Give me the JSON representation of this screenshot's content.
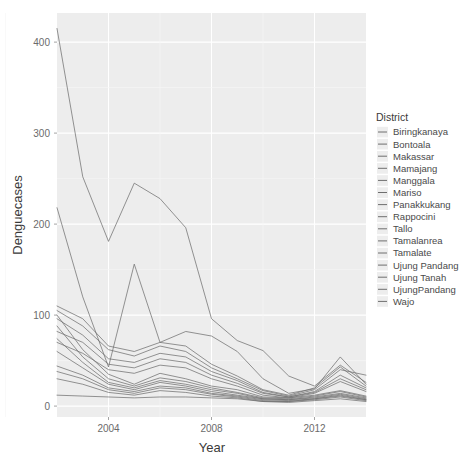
{
  "chart_data": {
    "type": "line",
    "title": "",
    "xlabel": "Year",
    "ylabel": "Denguecases",
    "xlim": [
      2002,
      2014
    ],
    "ylim": [
      -12,
      432
    ],
    "xticks": [
      2004,
      2008,
      2012
    ],
    "yticks": [
      0,
      100,
      200,
      300,
      400
    ],
    "xtick_labels": [
      "2004",
      "2008",
      "2012"
    ],
    "ytick_labels": [
      "0",
      "100",
      "200",
      "300",
      "400"
    ],
    "grid": true,
    "legend_position": "right",
    "legend_title": "District",
    "x": [
      2002,
      2003,
      2004,
      2005,
      2006,
      2007,
      2008,
      2009,
      2010,
      2011,
      2012,
      2013,
      2014
    ],
    "series": [
      {
        "name": "Biringkanaya",
        "values": [
          415,
          252,
          181,
          245,
          228,
          196,
          96,
          72,
          61,
          33,
          22,
          45,
          26
        ]
      },
      {
        "name": "Bontoala",
        "values": [
          100,
          62,
          35,
          24,
          36,
          30,
          22,
          18,
          10,
          9,
          12,
          17,
          11
        ]
      },
      {
        "name": "Makassar",
        "values": [
          88,
          54,
          30,
          22,
          31,
          27,
          20,
          15,
          9,
          8,
          11,
          16,
          10
        ]
      },
      {
        "name": "Mamajang",
        "values": [
          74,
          48,
          26,
          20,
          28,
          24,
          18,
          14,
          8,
          7,
          10,
          14,
          9
        ]
      },
      {
        "name": "Manggala",
        "values": [
          218,
          120,
          43,
          156,
          70,
          82,
          77,
          60,
          30,
          14,
          19,
          54,
          24
        ]
      },
      {
        "name": "Mariso",
        "values": [
          60,
          42,
          24,
          18,
          26,
          22,
          16,
          12,
          8,
          7,
          9,
          13,
          8
        ]
      },
      {
        "name": "Panakkukang",
        "values": [
          110,
          96,
          66,
          60,
          70,
          66,
          46,
          33,
          18,
          12,
          20,
          43,
          22
        ]
      },
      {
        "name": "Rappocini",
        "values": [
          105,
          88,
          62,
          55,
          66,
          60,
          42,
          30,
          17,
          11,
          18,
          40,
          34
        ]
      },
      {
        "name": "Tallo",
        "values": [
          96,
          78,
          52,
          48,
          58,
          54,
          38,
          28,
          15,
          10,
          16,
          34,
          20
        ]
      },
      {
        "name": "Tamalanrea",
        "values": [
          82,
          70,
          46,
          42,
          52,
          48,
          34,
          25,
          14,
          10,
          15,
          30,
          18
        ]
      },
      {
        "name": "Tamalate",
        "values": [
          70,
          58,
          40,
          36,
          45,
          42,
          30,
          22,
          12,
          9,
          14,
          27,
          16
        ]
      },
      {
        "name": "Ujung Pandang",
        "values": [
          44,
          34,
          20,
          16,
          22,
          20,
          14,
          11,
          7,
          6,
          8,
          12,
          7
        ]
      },
      {
        "name": "Ujung Tanah",
        "values": [
          38,
          30,
          18,
          14,
          20,
          18,
          13,
          10,
          6,
          5,
          8,
          11,
          7
        ]
      },
      {
        "name": "UjungPandang",
        "values": [
          30,
          24,
          15,
          12,
          17,
          15,
          11,
          9,
          5,
          5,
          7,
          10,
          6
        ]
      },
      {
        "name": "Wajo",
        "values": [
          12,
          11,
          10,
          9,
          10,
          10,
          9,
          8,
          5,
          4,
          6,
          8,
          5
        ]
      }
    ],
    "legend_entries": [
      "Biringkanaya",
      "Bontoala",
      "Makassar",
      "Mamajang",
      "Manggala",
      "Mariso",
      "Panakkukang",
      "Rappocini",
      "Tallo",
      "Tamalanrea",
      "Tamalate",
      "Ujung Pandang",
      "Ujung Tanah",
      "UjungPandang",
      "Wajo"
    ],
    "colors": {
      "panel_background": "#ededed",
      "gridline_major": "#ffffff",
      "gridline_minor": "#f7f7f7",
      "line_color": "#6e6e6e",
      "axis_text": "#6b6b6b",
      "axis_title": "#3a3a3a",
      "plot_background": "#ffffff",
      "legend_key_background": "#ededed"
    },
    "panel": {
      "left": 57,
      "top": 13,
      "right": 366,
      "bottom": 417
    },
    "legend_box": {
      "left": 376,
      "top": 113,
      "width": 92,
      "height": 185
    }
  }
}
